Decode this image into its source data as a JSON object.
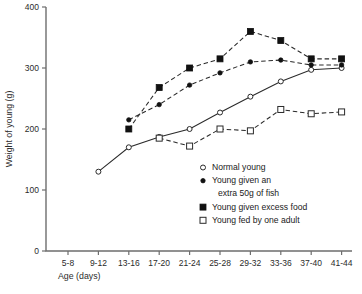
{
  "chart_data": {
    "type": "line",
    "title": "",
    "xlabel": "Age (days)",
    "ylabel": "Weight of young (g)",
    "categories": [
      "5-8",
      "9-12",
      "13-16",
      "17-20",
      "21-24",
      "25-28",
      "29-32",
      "33-36",
      "37-40",
      "41-44"
    ],
    "ylim": [
      0,
      400
    ],
    "yticks": [
      0,
      100,
      200,
      300,
      400
    ],
    "ytick_labels": [
      "0",
      "100",
      "200",
      "300",
      "400"
    ],
    "grid": false,
    "legend_position": "inside-lower-right",
    "series": [
      {
        "name": "Normal young",
        "marker": "open-circle",
        "line": "solid",
        "x": [
          "9-12",
          "13-16",
          "17-20",
          "21-24",
          "25-28",
          "29-32",
          "33-36",
          "37-40",
          "41-44"
        ],
        "values": [
          130,
          170,
          187,
          200,
          227,
          253,
          278,
          297,
          300
        ]
      },
      {
        "name": "Young given an extra 50g of fish",
        "marker": "filled-circle",
        "line": "dashed",
        "x": [
          "13-16",
          "17-20",
          "21-24",
          "25-28",
          "29-32",
          "33-36",
          "37-40",
          "41-44"
        ],
        "values": [
          215,
          240,
          272,
          292,
          310,
          313,
          305,
          305
        ]
      },
      {
        "name": "Young given excess food",
        "marker": "filled-square",
        "line": "dashed",
        "x": [
          "13-16",
          "17-20",
          "21-24",
          "25-28",
          "29-32",
          "33-36",
          "37-40",
          "41-44"
        ],
        "values": [
          200,
          268,
          300,
          315,
          360,
          345,
          315,
          315
        ]
      },
      {
        "name": "Young fed by one adult",
        "marker": "open-square",
        "line": "dashed",
        "x": [
          "17-20",
          "21-24",
          "25-28",
          "29-32",
          "33-36",
          "37-40",
          "41-44"
        ],
        "values": [
          185,
          172,
          200,
          197,
          232,
          225,
          228
        ]
      }
    ]
  },
  "legend": {
    "entries": [
      {
        "label": "Normal young",
        "marker": "open-circle"
      },
      {
        "label": "Young given an",
        "label2": "extra 50g of fish",
        "marker": "filled-circle"
      },
      {
        "label": "Young given excess food",
        "marker": "filled-square"
      },
      {
        "label": "Young fed by one adult",
        "marker": "open-square"
      }
    ]
  },
  "colors": {
    "ink": "#1a1a1a",
    "axis": "#6e6e6e",
    "marker_fill": "#111111",
    "marker_open": "#ffffff",
    "background": "#ffffff"
  }
}
